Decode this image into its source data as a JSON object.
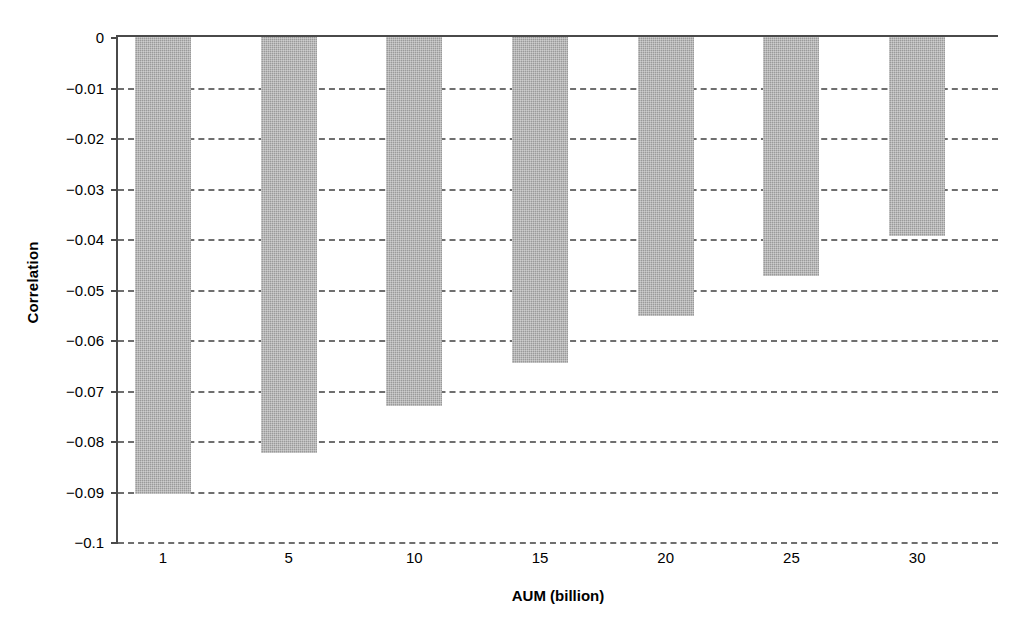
{
  "chart_data": {
    "type": "bar",
    "title": "",
    "xlabel": "AUM (billion)",
    "ylabel": "Correlation",
    "categories": [
      "1",
      "5",
      "10",
      "15",
      "20",
      "25",
      "30"
    ],
    "values": [
      -0.0905,
      -0.0824,
      -0.073,
      -0.0645,
      -0.0553,
      -0.0473,
      -0.0395
    ],
    "ylim": [
      -0.1,
      0
    ],
    "ytick_labels": [
      "0",
      "−0.01",
      "−0.02",
      "−0.03",
      "−0.04",
      "−0.05",
      "−0.06",
      "−0.07",
      "−0.08",
      "−0.09",
      "−0.1"
    ],
    "ytick_values": [
      0,
      -0.01,
      -0.02,
      -0.03,
      -0.04,
      -0.05,
      -0.06,
      -0.07,
      -0.08,
      -0.09,
      -0.1
    ],
    "grid": "horizontal-dashed",
    "legend": null,
    "bar_color": "#9a9a9a",
    "axis_color": "#4a4a4a",
    "grid_color": "#6f6f6f",
    "background": "#ffffff"
  }
}
